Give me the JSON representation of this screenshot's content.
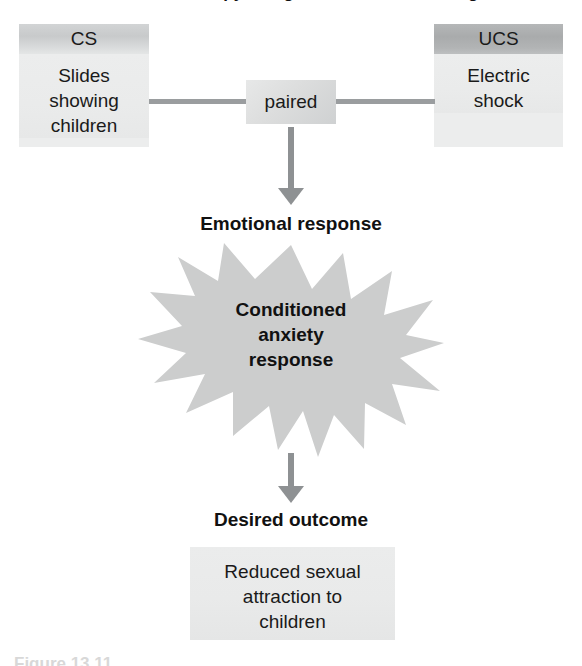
{
  "figure": {
    "title": "Aversion therapy using classical conditioning",
    "caption": "Figure 13.11"
  },
  "cs_box": {
    "header": "CS",
    "lines": [
      "Slides",
      "showing",
      "children"
    ]
  },
  "ucs_box": {
    "header": "UCS",
    "lines": [
      "Electric",
      "shock"
    ]
  },
  "paired_box": {
    "label": "paired"
  },
  "labels": {
    "emotional_response": "Emotional response",
    "desired_outcome": "Desired outcome"
  },
  "starburst": {
    "lines": [
      "Conditioned",
      "anxiety",
      "response"
    ],
    "fill_color": "#cccdcd",
    "points": 16
  },
  "outcome_box": {
    "lines": [
      "Reduced sexual",
      "attraction to",
      "children"
    ]
  },
  "colors": {
    "page_background": "#ffffff",
    "box_body": "#eceded",
    "cs_header": "#ced0d1",
    "ucs_header": "#aeb0b1",
    "paired_fill": "#dcdddd",
    "connector_line": "#9a9d9f",
    "arrow": "#8e9193",
    "text": "#1a1a1a"
  }
}
